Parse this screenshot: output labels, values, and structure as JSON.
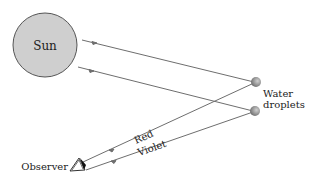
{
  "diagram": {
    "type": "rainbow-formation",
    "labels": {
      "sun": "Sun",
      "water_line1": "Water",
      "water_line2": "droplets",
      "red": "Red",
      "violet": "Violet",
      "observer": "Observer"
    },
    "colors": {
      "sun_fill": "#cfcfcf",
      "sun_stroke": "#555555",
      "ray": "#6e6e6e",
      "droplet": "#8a8a8a"
    }
  }
}
